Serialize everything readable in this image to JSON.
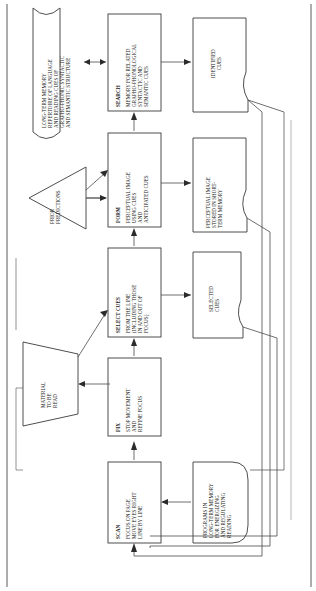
{
  "document": {
    "type": "flowchart",
    "title": "Model of the Reading Process",
    "orientation": "rotated-90",
    "page_border": true
  },
  "colors": {
    "stroke": "#3a3a3a",
    "connector": "#4a4a4a",
    "arrowhead": "#2b2b2b",
    "text": "#1a1a1a",
    "background": "#ffffff"
  },
  "nodes": [
    {
      "id": "long-term-memory",
      "shape": "wave-cylinder",
      "title": "",
      "lines": [
        "LONG-TERM MEMORY",
        "REPERTOIRE OF LANGUAGE",
        "AND READING CUES OF",
        "GRAPHO-PHONIC  SYNTACTIC",
        "AND SEMANTIC STRUCTURE"
      ]
    },
    {
      "id": "search",
      "shape": "rectangle",
      "title": "SEARCH",
      "lines": [
        "MEMORY FOR RELATED",
        "GRAPHO-PHONOLOGICAL",
        "SYNTACTIC  AND",
        "SEMANTIC CUES"
      ]
    },
    {
      "id": "identified-cues",
      "shape": "flag-document",
      "title": "",
      "lines": [
        "IDENTIFIED",
        "CUES"
      ]
    },
    {
      "id": "prior-predictions",
      "shape": "triangle",
      "title": "",
      "lines": [
        "PRIOR",
        "PREDICTIONS"
      ]
    },
    {
      "id": "form",
      "shape": "rectangle",
      "title": "FORM",
      "lines": [
        "PERCEPTUAL IMAGE",
        "USING CUES",
        "AND",
        "ANTICIPATED CUES"
      ]
    },
    {
      "id": "perceptual-image-stored",
      "shape": "flag-document",
      "title": "",
      "lines": [
        "PERCEPTUAL IMAGE",
        "STORED IN SHORT-",
        "TERM MEMORY"
      ]
    },
    {
      "id": "select-cues",
      "shape": "rectangle",
      "title": "SELECT CUES",
      "lines": [
        "FROM THE LINE",
        "(INCLUDING THOSE",
        "IN AND OUT OF",
        "FOCUS)"
      ]
    },
    {
      "id": "selected-cues",
      "shape": "flag-document",
      "title": "",
      "lines": [
        "SELECTED",
        "CUES"
      ]
    },
    {
      "id": "material-to-be-read",
      "shape": "trapezoid",
      "title": "",
      "lines": [
        "MATERIAL",
        "TO BE",
        "READ"
      ]
    },
    {
      "id": "fix",
      "shape": "rectangle",
      "title": "FIX",
      "lines": [
        "STOP MOVEMENT",
        "AND",
        "REFINE FOCUS"
      ]
    },
    {
      "id": "scan",
      "shape": "rectangle",
      "title": "SCAN",
      "lines": [
        "FOCUS ON PAGE",
        "MOVE EYES RIGHT",
        "LINE BY LINE"
      ]
    },
    {
      "id": "programs-long-term-memory",
      "shape": "stadium",
      "title": "",
      "lines": [
        "PROGRAMS IN",
        "LONG-TERM MEMORY",
        "FOR ENERGIZING",
        "AND REGULATING",
        "READING"
      ]
    }
  ],
  "connectors": [
    {
      "id": "ltm-search",
      "from": "long-term-memory",
      "to": "search",
      "arrows": "both"
    },
    {
      "id": "search-identified",
      "from": "search",
      "to": "identified-cues",
      "arrows": "forward"
    },
    {
      "id": "form-search",
      "from": "form",
      "to": "search",
      "arrows": "forward"
    },
    {
      "id": "form-perceptual",
      "from": "form",
      "to": "perceptual-image-stored",
      "arrows": "forward"
    },
    {
      "id": "select-form",
      "from": "select-cues",
      "to": "form",
      "arrows": "forward"
    },
    {
      "id": "select-selected",
      "from": "select-cues",
      "to": "selected-cues",
      "arrows": "forward"
    },
    {
      "id": "prior-form",
      "from": "prior-predictions",
      "to": "form",
      "arrows": "forward"
    },
    {
      "id": "prior-select",
      "from": "prior-predictions",
      "to": "select-cues",
      "arrows": "forward"
    },
    {
      "id": "material-select",
      "from": "material-to-be-read",
      "to": "select-cues",
      "arrows": "forward"
    },
    {
      "id": "fix-select",
      "from": "fix",
      "to": "select-cues",
      "arrows": "forward"
    },
    {
      "id": "scan-fix",
      "from": "scan",
      "to": "fix",
      "arrows": "forward"
    },
    {
      "id": "programs-scan",
      "from": "programs-long-term-memory",
      "to": "scan",
      "arrows": "forward"
    },
    {
      "id": "feedback-identified-scan",
      "from": "identified-cues",
      "to": "scan",
      "arrows": "forward"
    },
    {
      "id": "feedback-perceptual-scan",
      "from": "perceptual-image-stored",
      "to": "scan",
      "arrows": "forward"
    },
    {
      "id": "feedback-selected-scan",
      "from": "selected-cues",
      "to": "scan",
      "arrows": "forward"
    },
    {
      "id": "feedback-identified-programs",
      "from": "identified-cues",
      "to": "programs-long-term-memory",
      "arrows": "forward"
    }
  ]
}
